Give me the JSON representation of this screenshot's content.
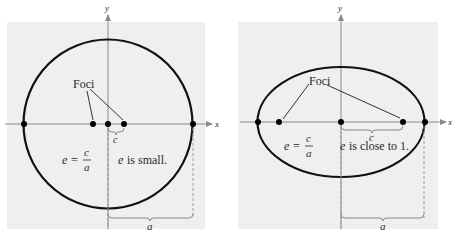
{
  "colors": {
    "panel_bg": "#efefef",
    "curve": "#111111",
    "axis": "#8a8a8a",
    "point": "#000000",
    "leader": "#333333",
    "dashed": "#9a9a9a",
    "brace": "#8a8a8a",
    "text": "#2a2a2a"
  },
  "left_panel": {
    "shape": "circle",
    "x_axis_label": "x",
    "y_axis_label": "y",
    "foci_label": "Foci",
    "c_label": "c",
    "a_label": "a",
    "formula_lhs": "e =",
    "formula_num": "c",
    "formula_den": "a",
    "e_var": "e",
    "description": "is small."
  },
  "right_panel": {
    "shape": "ellipse",
    "x_axis_label": "x",
    "y_axis_label": "y",
    "foci_label": "Foci",
    "c_label": "c",
    "a_label": "a",
    "formula_lhs": "e =",
    "formula_num": "c",
    "formula_den": "a",
    "e_var": "e",
    "description": "is close to 1."
  }
}
